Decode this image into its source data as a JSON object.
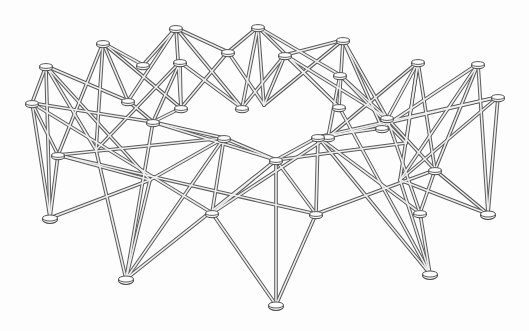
{
  "image": {
    "description": "Line drawing of a deployable circular scissor-truss ring structure made of straight struts joined at disc-shaped hub nodes",
    "width": 529,
    "height": 331,
    "background": "#fdfdfd",
    "strut_color": "#5a5a5a",
    "hub_color": "#f4f4f4"
  },
  "nodes": {
    "A1": [
      46,
      66
    ],
    "A2": [
      103,
      43
    ],
    "A3": [
      176,
      28
    ],
    "A4": [
      258,
      27
    ],
    "A5": [
      343,
      40
    ],
    "A6": [
      418,
      62
    ],
    "A7": [
      478,
      64
    ],
    "B1": [
      32,
      103
    ],
    "B2": [
      143,
      65
    ],
    "B3": [
      180,
      62
    ],
    "B4": [
      228,
      52
    ],
    "B5": [
      285,
      55
    ],
    "B6": [
      340,
      75
    ],
    "B7": [
      498,
      97
    ],
    "C1": [
      58,
      155
    ],
    "C2": [
      96,
      150
    ],
    "C3": [
      128,
      101
    ],
    "C4": [
      153,
      122
    ],
    "C5": [
      181,
      108
    ],
    "C6": [
      242,
      108
    ],
    "C7": [
      264,
      105
    ],
    "C8": [
      339,
      107
    ],
    "C9": [
      387,
      118
    ],
    "C10": [
      406,
      143
    ],
    "C11": [
      382,
      128
    ],
    "C12": [
      328,
      137
    ],
    "D1": [
      224,
      138
    ],
    "D2": [
      276,
      160
    ],
    "D3": [
      318,
      137
    ],
    "D4": [
      435,
      170
    ],
    "E1": [
      212,
      213
    ],
    "E2": [
      316,
      214
    ],
    "E3": [
      150,
      180
    ],
    "E4": [
      400,
      180
    ],
    "E5": [
      420,
      213
    ],
    "F1": [
      50,
      218
    ],
    "F2": [
      126,
      279
    ],
    "F3": [
      276,
      305
    ],
    "F4": [
      430,
      274
    ],
    "F5": [
      488,
      214
    ]
  },
  "struts": [
    [
      "A1",
      "B1"
    ],
    [
      "A1",
      "F1"
    ],
    [
      "A1",
      "C3"
    ],
    [
      "A1",
      "C2"
    ],
    [
      "A1",
      "E3"
    ],
    [
      "B1",
      "F1"
    ],
    [
      "B1",
      "C1"
    ],
    [
      "B1",
      "C4"
    ],
    [
      "B1",
      "E1"
    ],
    [
      "A2",
      "B2"
    ],
    [
      "A2",
      "C1"
    ],
    [
      "A2",
      "C3"
    ],
    [
      "A2",
      "C5"
    ],
    [
      "A2",
      "C2"
    ],
    [
      "A3",
      "B2"
    ],
    [
      "A3",
      "B4"
    ],
    [
      "A3",
      "C5"
    ],
    [
      "A3",
      "C6"
    ],
    [
      "A3",
      "C3"
    ],
    [
      "B3",
      "C4"
    ],
    [
      "B3",
      "C5"
    ],
    [
      "B3",
      "C6"
    ],
    [
      "B3",
      "C2"
    ],
    [
      "A4",
      "B4"
    ],
    [
      "A4",
      "C7"
    ],
    [
      "A4",
      "C6"
    ],
    [
      "A4",
      "C8"
    ],
    [
      "A4",
      "B6"
    ],
    [
      "B4",
      "C7"
    ],
    [
      "B4",
      "C5"
    ],
    [
      "B5",
      "C7"
    ],
    [
      "B5",
      "C8"
    ],
    [
      "B5",
      "C9"
    ],
    [
      "B5",
      "C6"
    ],
    [
      "A5",
      "B5"
    ],
    [
      "A5",
      "C8"
    ],
    [
      "A5",
      "C9"
    ],
    [
      "A5",
      "C11"
    ],
    [
      "A5",
      "C7"
    ],
    [
      "B6",
      "C9"
    ],
    [
      "B6",
      "C10"
    ],
    [
      "B6",
      "C12"
    ],
    [
      "A6",
      "C11"
    ],
    [
      "A6",
      "C10"
    ],
    [
      "A6",
      "E4"
    ],
    [
      "A6",
      "C12"
    ],
    [
      "A6",
      "D4"
    ],
    [
      "A7",
      "F5"
    ],
    [
      "A7",
      "C11"
    ],
    [
      "A7",
      "E4"
    ],
    [
      "A7",
      "D4"
    ],
    [
      "B7",
      "F5"
    ],
    [
      "B7",
      "C12"
    ],
    [
      "B7",
      "D3"
    ],
    [
      "B7",
      "E4"
    ],
    [
      "D1",
      "C1"
    ],
    [
      "D1",
      "E1"
    ],
    [
      "D1",
      "E3"
    ],
    [
      "D1",
      "F2"
    ],
    [
      "D1",
      "D2"
    ],
    [
      "D1",
      "C4"
    ],
    [
      "D2",
      "E1"
    ],
    [
      "D2",
      "E2"
    ],
    [
      "D2",
      "F3"
    ],
    [
      "D2",
      "C4"
    ],
    [
      "D2",
      "C10"
    ],
    [
      "D2",
      "F2"
    ],
    [
      "D3",
      "E2"
    ],
    [
      "D3",
      "E5"
    ],
    [
      "D3",
      "F4"
    ],
    [
      "D3",
      "D2"
    ],
    [
      "D3",
      "C11"
    ],
    [
      "D4",
      "E5"
    ],
    [
      "D4",
      "F5"
    ],
    [
      "D4",
      "E2"
    ],
    [
      "D4",
      "C9"
    ],
    [
      "E3",
      "F1"
    ],
    [
      "E3",
      "F2"
    ],
    [
      "C2",
      "F2"
    ],
    [
      "C4",
      "F2"
    ],
    [
      "E1",
      "F3"
    ],
    [
      "E1",
      "C12"
    ],
    [
      "E2",
      "F3"
    ],
    [
      "E2",
      "C1"
    ],
    [
      "E5",
      "F4"
    ],
    [
      "E5",
      "C9"
    ],
    [
      "F4",
      "C8"
    ],
    [
      "F4",
      "E4"
    ],
    [
      "F5",
      "E4"
    ],
    [
      "C1",
      "F1"
    ],
    [
      "C1",
      "E3"
    ],
    [
      "C3",
      "C4"
    ],
    [
      "C5",
      "C4"
    ]
  ],
  "hubs": [
    "A1",
    "A2",
    "A3",
    "A4",
    "A5",
    "A6",
    "A7",
    "B1",
    "B2",
    "B3",
    "B4",
    "B5",
    "B6",
    "B7",
    "C1",
    "C3",
    "C4",
    "C5",
    "C6",
    "C8",
    "C9",
    "C11",
    "C12",
    "D1",
    "D2",
    "D3",
    "D4",
    "E1",
    "E2",
    "E5",
    "F1",
    "F2",
    "F3",
    "F4",
    "F5"
  ],
  "foot_hubs": [
    "F1",
    "F2",
    "F3",
    "F4",
    "F5"
  ]
}
